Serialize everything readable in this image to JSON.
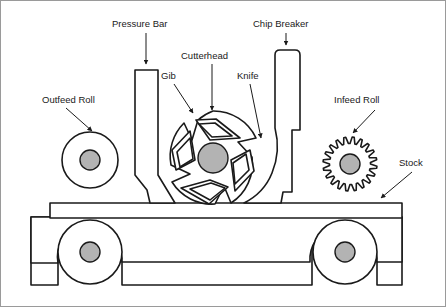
{
  "figure": {
    "background_color": "#ffffff",
    "line_color": "#1a1a1a",
    "hub_fill_color": "#b3b3b3",
    "border_color": "#9a9a9a",
    "width": 446,
    "height": 307
  },
  "labels": [
    {
      "id": "pressure-bar",
      "text": "Pressure Bar",
      "x": 112,
      "y": 27
    },
    {
      "id": "chip-breaker",
      "text": "Chip Breaker",
      "x": 253,
      "y": 27
    },
    {
      "id": "cutterhead",
      "text": "Cutterhead",
      "x": 181,
      "y": 59
    },
    {
      "id": "gib",
      "text": "Gib",
      "x": 161,
      "y": 79
    },
    {
      "id": "knife",
      "text": "Knife",
      "x": 237,
      "y": 79
    },
    {
      "id": "outfeed-roll",
      "text": "Outfeed Roll",
      "x": 42,
      "y": 103
    },
    {
      "id": "infeed-roll",
      "text": "Infeed Roll",
      "x": 334,
      "y": 103
    },
    {
      "id": "stock",
      "text": "Stock",
      "x": 399,
      "y": 166
    }
  ],
  "parts": [
    {
      "id": "outfeed-roll",
      "name": "Outfeed Roll",
      "shape": "circle",
      "cx": 90,
      "cy": 160,
      "r": 28,
      "hub_r": 10
    },
    {
      "id": "infeed-roll",
      "name": "Infeed Roll",
      "shape": "gear",
      "cx": 350,
      "cy": 164,
      "r": 27,
      "hub_r": 10,
      "teeth": 20
    },
    {
      "id": "cutterhead",
      "name": "Cutterhead",
      "shape": "circle",
      "cx": 213,
      "cy": 158,
      "r": 47,
      "hub_r": 15,
      "knives": 4
    },
    {
      "id": "pressure-bar",
      "name": "Pressure Bar",
      "shape": "bar"
    },
    {
      "id": "chip-breaker",
      "name": "Chip Breaker",
      "shape": "bar"
    },
    {
      "id": "stock",
      "name": "Stock",
      "shape": "board"
    },
    {
      "id": "bed-roll-left",
      "name": "Bed Roll Left",
      "shape": "circle",
      "cx": 90,
      "cy": 252,
      "r": 32,
      "hub_r": 10
    },
    {
      "id": "bed-roll-right",
      "name": "Bed Roll Right",
      "shape": "circle",
      "cx": 345,
      "cy": 252,
      "r": 32,
      "hub_r": 10
    },
    {
      "id": "machine-bed",
      "name": "Machine Bed Frame",
      "shape": "frame"
    }
  ]
}
